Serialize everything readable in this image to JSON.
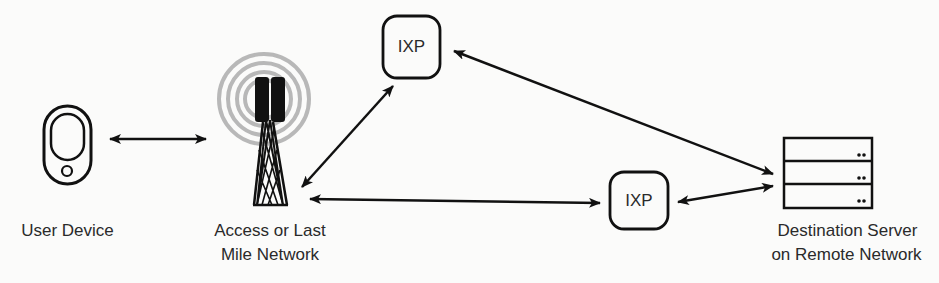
{
  "diagram": {
    "type": "network-path",
    "nodes": [
      {
        "id": "user",
        "label": "User Device",
        "icon": "smartphone-icon"
      },
      {
        "id": "access",
        "label_line1": "Access or Last",
        "label_line2": "Mile Network",
        "icon": "cell-tower-icon"
      },
      {
        "id": "ixp_top",
        "label": "IXP",
        "icon": "rounded-box"
      },
      {
        "id": "ixp_bottom",
        "label": "IXP",
        "icon": "rounded-box"
      },
      {
        "id": "server",
        "label_line1": "Destination Server",
        "label_line2": "on Remote Network",
        "icon": "server-rack-icon"
      }
    ],
    "edges": [
      {
        "from": "user",
        "to": "access",
        "direction": "both"
      },
      {
        "from": "access",
        "to": "ixp_top",
        "direction": "both"
      },
      {
        "from": "access",
        "to": "ixp_bottom",
        "direction": "both"
      },
      {
        "from": "ixp_top",
        "to": "server",
        "direction": "both"
      },
      {
        "from": "ixp_bottom",
        "to": "server",
        "direction": "both"
      }
    ],
    "colors": {
      "stroke": "#111111",
      "rings": "#b5b5b5",
      "background": "#fbfbfa",
      "text": "#2a2a2a"
    }
  }
}
